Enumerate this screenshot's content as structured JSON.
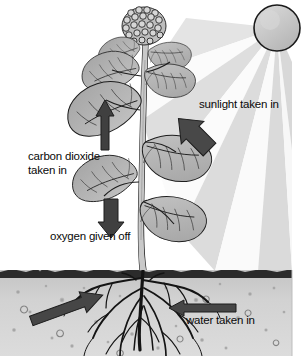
{
  "diagram": {
    "background_color": "#ffffff",
    "labels": {
      "sunlight": "sunlight taken in",
      "carbon_dioxide_line1": "carbon dioxide",
      "carbon_dioxide_line2": "taken in",
      "oxygen": "oxygen given off",
      "water": "water taken in"
    },
    "colors": {
      "ink": "#0a0a0a",
      "arrow": "#3e3e3e",
      "arrow_dark": "#434343",
      "leaf_fill": "#b4b4b4",
      "leaf_line": "#1d1d1d",
      "stem": "#c8c8c8",
      "sun_fill": "#c6c6c6",
      "sun_outline": "#1a1a1a",
      "soil_top": "#c9c9c9",
      "soil_bottom": "#d8d8d8",
      "soil_line": "#2a2a2a",
      "root": "#141414",
      "ray_light": "#ffffff",
      "ray_grey": "#d7d7d7"
    },
    "elements": {
      "sun": {
        "name": "sun",
        "cx": 277,
        "cy": 28,
        "r": 23
      },
      "sunbeams": {
        "name": "sun-rays",
        "origin_x": 277,
        "origin_y": 28,
        "count": 7
      },
      "ground_line_y": 270,
      "stem_x": 141,
      "flower_cluster": {
        "cx": 144,
        "cy": 26
      },
      "arrows": [
        {
          "name": "carbon-dioxide-arrow",
          "direction": "up",
          "x": 96,
          "y": 100,
          "length": 50
        },
        {
          "name": "oxygen-arrow",
          "direction": "down",
          "x": 112,
          "y": 199,
          "length": 37
        },
        {
          "name": "sunlight-arrow",
          "direction": "down-left",
          "x": 194,
          "y": 134,
          "length": 44
        },
        {
          "name": "water-arrow",
          "direction": "left",
          "x": 203,
          "y": 308,
          "length": 66
        },
        {
          "name": "minerals-arrow",
          "direction": "up-right",
          "x": 67,
          "y": 308,
          "length": 70
        }
      ]
    }
  }
}
